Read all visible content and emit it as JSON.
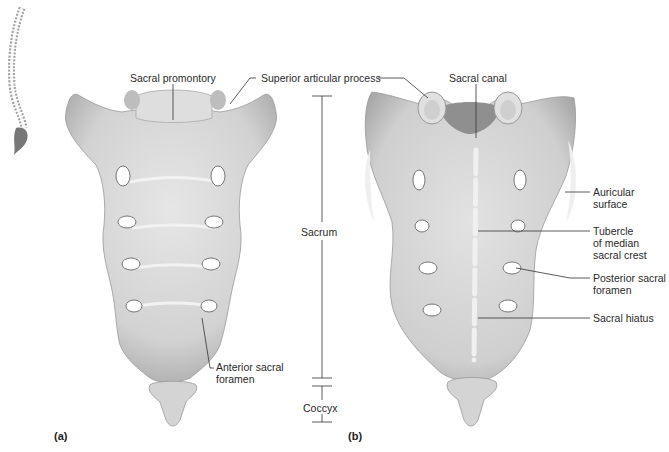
{
  "figure": {
    "panels": [
      {
        "id": "a",
        "label": "(a)",
        "view": "anterior"
      },
      {
        "id": "b",
        "label": "(b)",
        "view": "posterior"
      }
    ],
    "labels": {
      "sacral_promontory": "Sacral promontory",
      "superior_articular_process": "Superior articular process",
      "sacral_canal": "Sacral canal",
      "sacrum": "Sacrum",
      "coccyx": "Coccyx",
      "anterior_sacral_foramen_1": "Anterior sacral",
      "anterior_sacral_foramen_2": "foramen",
      "auricular_surface_1": "Auricular",
      "auricular_surface_2": "surface",
      "tubercle_1": "Tubercle",
      "tubercle_2": "of median",
      "tubercle_3": "sacral crest",
      "posterior_sacral_foramen_1": "Posterior sacral",
      "posterior_sacral_foramen_2": "foramen",
      "sacral_hiatus": "Sacral hiatus"
    },
    "colors": {
      "bone": "#d9d9d9",
      "bone_shadow": "#a8a8a8",
      "leader_line": "#333333",
      "background": "#ffffff"
    }
  }
}
